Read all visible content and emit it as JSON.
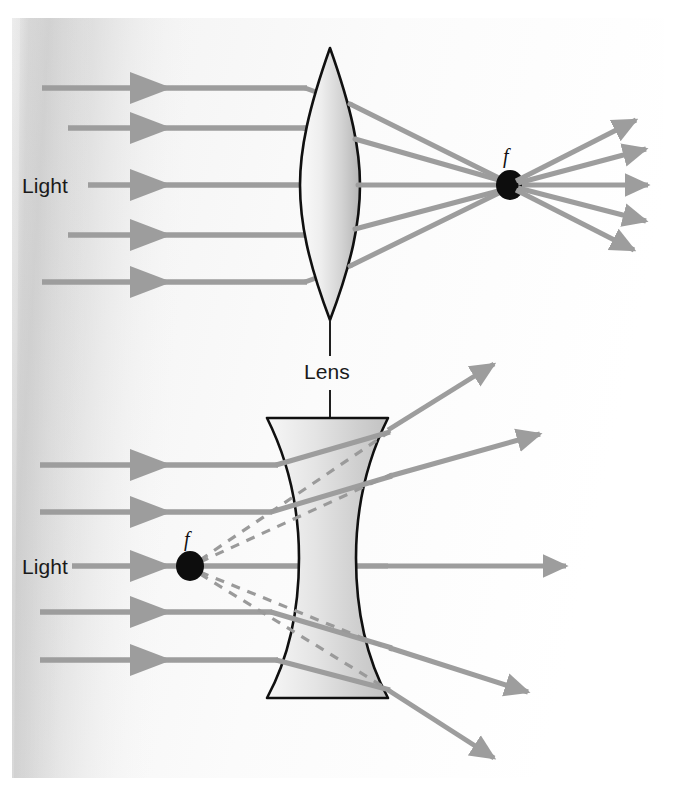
{
  "figure": {
    "canvas": {
      "width": 676,
      "height": 793
    },
    "background_color": "#ffffff",
    "paper_tint": "#f2f2f2"
  },
  "colors": {
    "ray": "#9d9d9d",
    "ray_dark": "#8f8f8f",
    "dashed_ray": "#9a9a9a",
    "lens_outline": "#101010",
    "lens_fill_light": "#f4f4f4",
    "lens_fill_dark": "#b9b9b9",
    "focal_dot": "#0d0d0d",
    "label_text": "#1a1a1a",
    "leader_line": "#202020",
    "shadow": "#c9c9c9"
  },
  "labels": {
    "light_top": "Light",
    "light_bottom": "Light",
    "lens": "Lens",
    "focal_top": "f",
    "focal_bottom": "f"
  },
  "panels": [
    {
      "id": "converging",
      "lens_type": "biconvex",
      "caption": "Lens",
      "light_label": "Light",
      "focal_label": "f",
      "focal_point": {
        "x": 510,
        "y": 185
      },
      "lens": {
        "cx": 330,
        "top_y": 48,
        "bottom_y": 320,
        "half_width": 30
      },
      "incoming_rays": [
        {
          "y": 88,
          "x_start": 42,
          "arrow_x": 152
        },
        {
          "y": 128,
          "x_start": 68,
          "arrow_x": 152
        },
        {
          "y": 185,
          "x_start": 88,
          "arrow_x": 152
        },
        {
          "y": 235,
          "x_start": 68,
          "arrow_x": 152
        },
        {
          "y": 282,
          "x_start": 42,
          "arrow_x": 152
        }
      ],
      "outgoing_rays": [
        {
          "x_end": 655,
          "y_end": 114
        },
        {
          "x_end": 668,
          "y_end": 146
        },
        {
          "x_end": 672,
          "y_end": 185
        },
        {
          "x_end": 668,
          "y_end": 224
        },
        {
          "x_end": 652,
          "y_end": 256
        }
      ]
    },
    {
      "id": "diverging",
      "lens_type": "biconcave",
      "caption": "Lens",
      "light_label": "Light",
      "focal_label": "f",
      "focal_point": {
        "x": 190,
        "y": 566
      },
      "lens": {
        "left_x": 267,
        "right_x": 388,
        "top_y": 418,
        "bottom_y": 698,
        "waist_inset": 26
      },
      "incoming_rays": [
        {
          "y": 465,
          "x_start": 40,
          "arrow_x": 152
        },
        {
          "y": 512,
          "x_start": 40,
          "arrow_x": 152
        },
        {
          "y": 566,
          "x_start": 72,
          "arrow_x": 152
        },
        {
          "y": 612,
          "x_start": 40,
          "arrow_x": 152
        },
        {
          "y": 660,
          "x_start": 40,
          "arrow_x": 152
        }
      ],
      "outgoing_rays": [
        {
          "x_end": 510,
          "y_end": 355
        },
        {
          "x_end": 555,
          "y_end": 427
        },
        {
          "x_end": 578,
          "y_end": 566
        },
        {
          "x_end": 540,
          "y_end": 700
        },
        {
          "x_end": 505,
          "y_end": 768
        }
      ],
      "virtual_rays_dashed": 4
    }
  ]
}
